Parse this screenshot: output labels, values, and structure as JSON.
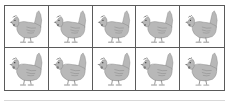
{
  "figure": {
    "rows": 2,
    "columns": 5,
    "total_items": 10,
    "item_icon": "hen-icon",
    "colors": {
      "border": "#5a5a5a",
      "hen_body": "#b8b8b8",
      "hen_dark": "#7a7a7a",
      "baseline": "#d8d8d8"
    },
    "cells": [
      {
        "filled": true,
        "icon": "hen-icon"
      },
      {
        "filled": true,
        "icon": "hen-icon"
      },
      {
        "filled": true,
        "icon": "hen-icon"
      },
      {
        "filled": true,
        "icon": "hen-icon"
      },
      {
        "filled": true,
        "icon": "hen-icon"
      },
      {
        "filled": true,
        "icon": "hen-icon"
      },
      {
        "filled": true,
        "icon": "hen-icon"
      },
      {
        "filled": true,
        "icon": "hen-icon"
      },
      {
        "filled": true,
        "icon": "hen-icon"
      },
      {
        "filled": true,
        "icon": "hen-icon"
      }
    ]
  }
}
